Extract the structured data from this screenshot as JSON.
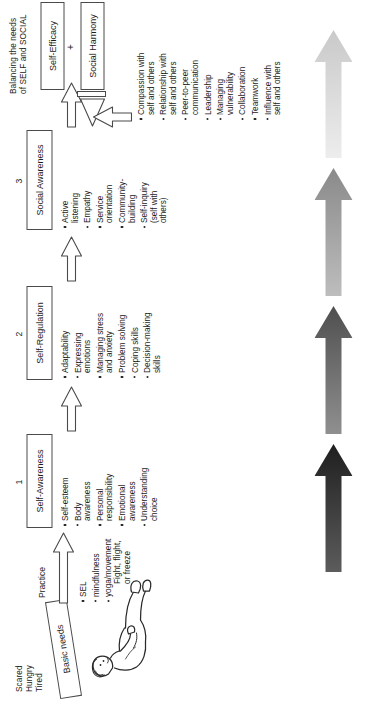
{
  "diagram": {
    "title_note": "Balancing the needs\nof SELF and SOCIAL",
    "outcome": {
      "self_efficacy": "Self-Efficacy",
      "plus": "+",
      "social_harmony": "Social Harmony"
    },
    "baseline": {
      "states": "Scared\nHungry\nTired",
      "basic_needs": "Basic needs",
      "stress_response": "Fight, flight,\nor freeze"
    },
    "practice": {
      "label": "Practice",
      "items": [
        "SEL",
        "mindfulness",
        "yoga/movement"
      ]
    },
    "stages": [
      {
        "number": "1",
        "name": "Self-Awareness",
        "items": [
          "Self-esteem",
          "Body\nawareness",
          "Personal\nresponsibility",
          "Emotional\nawareness",
          "Understanding\nchoice"
        ]
      },
      {
        "number": "2",
        "name": "Self-Regulation",
        "items": [
          "Adaptability",
          "Expressing\nemotions",
          "Managing stress\nand anxiety",
          "Problem solving",
          "Coping skills",
          "Decision-making\nskills"
        ]
      },
      {
        "number": "3",
        "name": "Social Awareness",
        "items": [
          "Active\nlistening",
          "Empathy",
          "Service\norientation",
          "Community-\nbuilding",
          "Self-inquiry\n(self with\nothers)"
        ]
      }
    ],
    "harmony_items": [
      "Compassion with\nself and others",
      "Relationship with\nself and others",
      "Peer-to-peer\ncommunication",
      "Leadership",
      "Managing\nvulnerability",
      "Collaboration",
      "Teamwork",
      "Influence with\nself and others"
    ],
    "progress_arrows": [
      {
        "name": "arrow-darkest",
        "from": "#5c5c5c",
        "to": "#1f1f1f"
      },
      {
        "name": "arrow-dark",
        "from": "#8f8f8f",
        "to": "#4f4f4f"
      },
      {
        "name": "arrow-mid",
        "from": "#bdbdbd",
        "to": "#8a8a8a"
      },
      {
        "name": "arrow-light",
        "from": "#ededed",
        "to": "#c9c9c9"
      }
    ],
    "colors": {
      "ink": "#222222",
      "stroke": "#4a4a4a"
    }
  }
}
